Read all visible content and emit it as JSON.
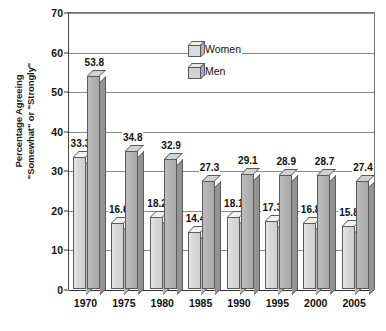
{
  "chart_data": {
    "type": "bar",
    "title": "",
    "xlabel": "",
    "ylabel_line1": "Percentage Agreeing",
    "ylabel_line2": "\"Somewhat\" or \"Strongly\"",
    "categories": [
      "1970",
      "1975",
      "1980",
      "1985",
      "1990",
      "1995",
      "2000",
      "2005"
    ],
    "series": [
      {
        "name": "Women",
        "icon": "cube-icon-light",
        "values": [
          33.3,
          16.6,
          18.2,
          14.4,
          18.1,
          17.3,
          16.8,
          15.8
        ],
        "labels": [
          "33.3",
          "16.6",
          "18.2",
          "14.4",
          "18.1",
          "17.3",
          "16.8",
          "15.8"
        ],
        "color": "#d6d6d6"
      },
      {
        "name": "Men",
        "icon": "cube-icon-dark",
        "values": [
          53.8,
          34.8,
          32.9,
          27.3,
          29.1,
          28.9,
          28.7,
          27.4
        ],
        "labels": [
          "53.8",
          "34.8",
          "32.9",
          "27.3",
          "29.1",
          "28.9",
          "28.7",
          "27.4"
        ],
        "color": "#b2b2b2"
      }
    ],
    "ylim": [
      0,
      70
    ],
    "yticks": [
      0,
      10,
      20,
      30,
      40,
      50,
      60,
      70
    ],
    "ytick_labels": [
      "0",
      "10",
      "20",
      "30",
      "40",
      "50",
      "60",
      "70"
    ],
    "grid": true,
    "legend_position": "top-center",
    "legend_entries": [
      "Women",
      "Men"
    ]
  }
}
